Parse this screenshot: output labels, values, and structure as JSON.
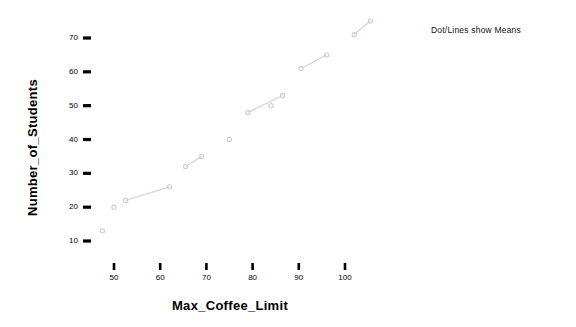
{
  "chart_data": {
    "type": "scatter",
    "title": "",
    "xlabel": "Max_Coffee_Limit",
    "ylabel": "Number_of_Students",
    "xlim": [
      44,
      110
    ],
    "ylim": [
      8,
      78
    ],
    "grid": false,
    "legend": null,
    "annotation": "Dot/Lines show Means",
    "xticks": [
      50,
      60,
      70,
      80,
      90,
      100
    ],
    "yticks": [
      10,
      20,
      30,
      40,
      50,
      60,
      70
    ],
    "marker_color": "#c9cdd6",
    "line_color": "#d2d6dd",
    "points": [
      {
        "x": 47.5,
        "y": 13
      },
      {
        "x": 50.0,
        "y": 20
      },
      {
        "x": 52.5,
        "y": 22
      },
      {
        "x": 62.0,
        "y": 26
      },
      {
        "x": 65.5,
        "y": 32
      },
      {
        "x": 69.0,
        "y": 35
      },
      {
        "x": 75.0,
        "y": 40
      },
      {
        "x": 79.0,
        "y": 48
      },
      {
        "x": 84.0,
        "y": 50
      },
      {
        "x": 86.5,
        "y": 53
      },
      {
        "x": 90.5,
        "y": 61
      },
      {
        "x": 96.0,
        "y": 65
      },
      {
        "x": 102.0,
        "y": 71
      },
      {
        "x": 105.5,
        "y": 75
      }
    ],
    "segments": [
      [
        {
          "x": 52.5,
          "y": 22
        },
        {
          "x": 62.0,
          "y": 26
        }
      ],
      [
        {
          "x": 65.5,
          "y": 32
        },
        {
          "x": 69.0,
          "y": 35
        }
      ],
      [
        {
          "x": 79.0,
          "y": 48
        },
        {
          "x": 86.5,
          "y": 53
        }
      ],
      [
        {
          "x": 90.5,
          "y": 61
        },
        {
          "x": 96.0,
          "y": 65
        }
      ],
      [
        {
          "x": 102.0,
          "y": 71
        },
        {
          "x": 105.5,
          "y": 75
        }
      ]
    ]
  },
  "axes": {
    "x_title": "Max_Coffee_Limit",
    "y_title": "Number_of_Students",
    "x_tick_labels": [
      "50",
      "60",
      "70",
      "80",
      "90",
      "100"
    ],
    "y_tick_labels": [
      "10",
      "20",
      "30",
      "40",
      "50",
      "60",
      "70"
    ]
  },
  "annotation": {
    "text": "Dot/Lines show Means"
  }
}
